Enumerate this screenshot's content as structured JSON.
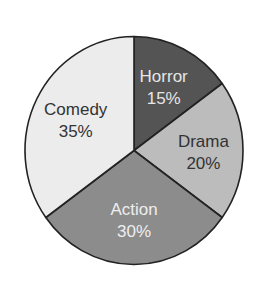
{
  "chart_data": {
    "type": "pie",
    "title": "",
    "start": "12 o'clock",
    "direction": "clockwise",
    "slices": [
      {
        "label": "Horror",
        "value": 15,
        "display": "15%",
        "color": "#545454",
        "text_color": "#e6e6e6"
      },
      {
        "label": "Drama",
        "value": 20,
        "display": "20%",
        "color": "#bcbcbc",
        "text_color": "#333333"
      },
      {
        "label": "Action",
        "value": 30,
        "display": "30%",
        "color": "#8c8c8c",
        "text_color": "#eeeeee"
      },
      {
        "label": "Comedy",
        "value": 35,
        "display": "35%",
        "color": "#ececec",
        "text_color": "#333333"
      }
    ]
  }
}
